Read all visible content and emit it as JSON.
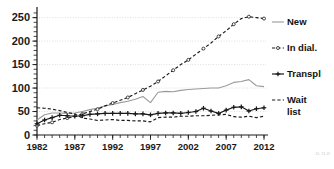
{
  "chart_data": {
    "type": "line",
    "title": "",
    "subtitle": "",
    "xlabel": "",
    "ylabel": "",
    "xlim": [
      1982,
      2012
    ],
    "ylim": [
      0,
      262
    ],
    "yticks": [
      0,
      50,
      100,
      150,
      200,
      250
    ],
    "xticks": [
      1982,
      1987,
      1992,
      1997,
      2002,
      2007,
      2012
    ],
    "xtick_labels": [
      "1982",
      "1987",
      "1992",
      "1997",
      "2002",
      "2007",
      "2012"
    ],
    "ytick_labels": [
      "0",
      "50",
      "100",
      "150",
      "200",
      "250"
    ],
    "minor_xticks_every": 1,
    "grid": "horizontal-dotted",
    "legend_position": "right",
    "x": [
      1982,
      1983,
      1984,
      1985,
      1986,
      1987,
      1988,
      1989,
      1990,
      1991,
      1992,
      1993,
      1994,
      1995,
      1996,
      1997,
      1998,
      1999,
      2000,
      2001,
      2002,
      2003,
      2004,
      2005,
      2006,
      2007,
      2008,
      2009,
      2010,
      2011,
      2012
    ],
    "series": [
      {
        "name": "New",
        "style": "solid",
        "color": "#9a9a9a",
        "marker": "none",
        "values": [
          32,
          43,
          47,
          47,
          46,
          47,
          50,
          54,
          57,
          62,
          65,
          69,
          72,
          76,
          82,
          69,
          91,
          93,
          92,
          95,
          97,
          98,
          99,
          100,
          100,
          105,
          112,
          114,
          118,
          105,
          103
        ]
      },
      {
        "name": "In dial.",
        "style": "dashed",
        "color": "#1a1a1a",
        "marker": "circle-open",
        "values": [
          20,
          24,
          27,
          33,
          36,
          39,
          45,
          50,
          55,
          62,
          68,
          74,
          80,
          88,
          96,
          104,
          114,
          126,
          138,
          150,
          160,
          172,
          184,
          196,
          210,
          222,
          236,
          248,
          252,
          250,
          248
        ]
      },
      {
        "name": "Transpl",
        "style": "solid",
        "color": "#1a1a1a",
        "marker": "plus",
        "values": [
          24,
          32,
          37,
          42,
          41,
          40,
          41,
          44,
          45,
          46,
          46,
          46,
          46,
          45,
          45,
          43,
          46,
          47,
          47,
          46,
          48,
          50,
          57,
          51,
          46,
          53,
          59,
          60,
          51,
          56,
          58
        ]
      },
      {
        "name": "Wait list",
        "style": "dashed",
        "color": "#1a1a1a",
        "marker": "none",
        "values": [
          58,
          57,
          55,
          52,
          48,
          45,
          36,
          34,
          31,
          32,
          33,
          31,
          31,
          30,
          30,
          28,
          37,
          38,
          38,
          40,
          40,
          41,
          41,
          42,
          43,
          44,
          39,
          38,
          40,
          37,
          40
        ]
      }
    ]
  },
  "legend": {
    "items": [
      {
        "label": "New"
      },
      {
        "label": "In dial."
      },
      {
        "label": "Transpl"
      },
      {
        "label": "Wait"
      },
      {
        "label": "list"
      }
    ]
  },
  "watermark": {
    "text": "ıı. ıı.ıı"
  }
}
